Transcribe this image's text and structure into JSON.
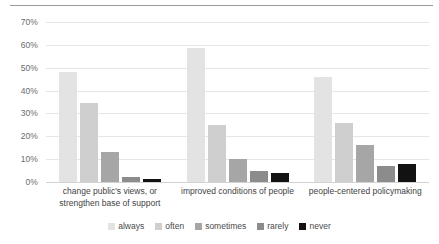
{
  "chart_data": {
    "type": "bar",
    "title": "",
    "subtitle": "",
    "xlabel": "",
    "ylabel": "",
    "ylim": [
      0,
      70
    ],
    "ytick_labels": [
      "0%",
      "10%",
      "20%",
      "30%",
      "40%",
      "50%",
      "60%",
      "70%"
    ],
    "ytick_values": [
      0,
      10,
      20,
      30,
      40,
      50,
      60,
      70
    ],
    "grid": true,
    "legend_position": "bottom",
    "categories": [
      "change public's views, or strengthen base of support",
      "improved conditions of people",
      "people-centered policymaking"
    ],
    "series": [
      {
        "name": "always",
        "color": "#e3e3e3",
        "values": [
          48,
          58.5,
          46
        ]
      },
      {
        "name": "often",
        "color": "#cfcfcf",
        "values": [
          34.5,
          25,
          26
        ]
      },
      {
        "name": "sometimes",
        "color": "#a6a6a6",
        "values": [
          13,
          10,
          16
        ]
      },
      {
        "name": "rarely",
        "color": "#8c8c8c",
        "values": [
          2,
          5,
          7
        ]
      },
      {
        "name": "never",
        "color": "#121212",
        "values": [
          1.5,
          4,
          8
        ]
      }
    ]
  },
  "legend": {
    "items": [
      {
        "label": "always",
        "color": "#e3e3e3"
      },
      {
        "label": "often",
        "color": "#cfcfcf"
      },
      {
        "label": "sometimes",
        "color": "#a6a6a6"
      },
      {
        "label": "rarely",
        "color": "#8c8c8c"
      },
      {
        "label": "never",
        "color": "#121212"
      }
    ]
  },
  "style": {
    "gridline_color": "#e6e6e6",
    "axis_color": "#d2d2d2",
    "top_rule_color": "#9a9a9a",
    "tick_text_color": "#6b6b6b",
    "category_text_color": "#3f3f3f",
    "background": "#ffffff"
  }
}
